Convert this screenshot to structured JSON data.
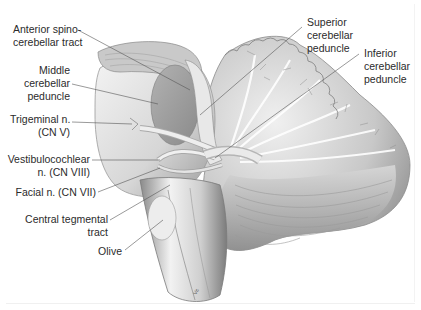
{
  "figure": {
    "signature": "Vc",
    "colors": {
      "background": "#ffffff",
      "label_text": "#2b2b2b",
      "leader_line": "#555555",
      "tissue_light": "#e6e6e6",
      "tissue_mid": "#b8b8b8",
      "tissue_dark": "#7a7a7a",
      "peduncle_oval": "#9e9e9e"
    }
  },
  "labels": [
    {
      "id": "anterior-spinocerebellar-tract",
      "lines": [
        "Anterior spino-",
        "cerebellar tract"
      ]
    },
    {
      "id": "middle-cerebellar-peduncle",
      "lines": [
        "Middle",
        "cerebellar",
        "peduncle"
      ]
    },
    {
      "id": "trigeminal-nerve",
      "lines": [
        "Trigeminal n.",
        "(CN V)"
      ]
    },
    {
      "id": "vestibulocochlear-nerve",
      "lines": [
        "Vestibulocochlear",
        "n. (CN VIII)"
      ]
    },
    {
      "id": "facial-nerve",
      "lines": [
        "Facial n. (CN VII)"
      ]
    },
    {
      "id": "central-tegmental-tract",
      "lines": [
        "Central tegmental",
        "tract"
      ]
    },
    {
      "id": "olive",
      "lines": [
        "Olive"
      ]
    },
    {
      "id": "superior-cerebellar-peduncle",
      "lines": [
        "Superior",
        "cerebellar",
        "peduncle"
      ]
    },
    {
      "id": "inferior-cerebellar-peduncle",
      "lines": [
        "Inferior",
        "cerebellar",
        "peduncle"
      ]
    }
  ]
}
